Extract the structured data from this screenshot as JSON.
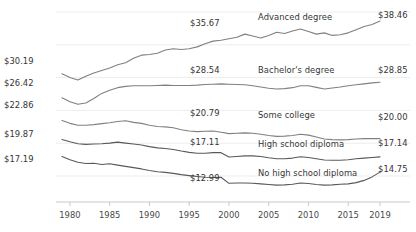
{
  "chart_data": {
    "type": "line",
    "title": "",
    "subtitle": "",
    "xlabel": "",
    "ylabel": "",
    "grid": true,
    "legend_position": "inline-right-of-line",
    "xlim": [
      1979,
      2019
    ],
    "ylim": [
      11.0,
      40.5
    ],
    "x_ticks": [
      "1980",
      "1985",
      "1990",
      "1995",
      "2000",
      "2005",
      "2010",
      "2015",
      "2019"
    ],
    "x_tick_values": [
      1980,
      1985,
      1990,
      1995,
      2000,
      2005,
      2010,
      2015,
      2019
    ],
    "y_ticks": [],
    "x": [
      1979,
      1980,
      1981,
      1982,
      1983,
      1984,
      1985,
      1986,
      1987,
      1988,
      1989,
      1990,
      1991,
      1992,
      1993,
      1994,
      1995,
      1996,
      1997,
      1998,
      1999,
      2000,
      2001,
      2002,
      2003,
      2004,
      2005,
      2006,
      2007,
      2008,
      2009,
      2010,
      2011,
      2012,
      2013,
      2014,
      2015,
      2016,
      2017,
      2018,
      2019
    ],
    "series": [
      {
        "name": "Advanced degree",
        "label": "Advanced degree",
        "color": "#808080",
        "start_label": "$35.67",
        "end_label": "$38.46",
        "start_value": 35.67,
        "end_value": 38.46,
        "values": [
          30.19,
          29.6,
          29.2,
          29.8,
          30.3,
          30.7,
          31.1,
          31.6,
          31.9,
          32.6,
          33.1,
          33.2,
          33.4,
          33.9,
          34.1,
          34.0,
          34.1,
          34.4,
          34.9,
          35.3,
          35.45,
          35.67,
          35.9,
          36.4,
          36.1,
          35.8,
          36.2,
          36.7,
          36.5,
          36.9,
          37.2,
          36.8,
          36.4,
          36.6,
          36.2,
          36.3,
          36.6,
          37.1,
          37.6,
          37.9,
          38.46
        ]
      },
      {
        "name": "Bachelor's degree",
        "label": "Bachelor's degree",
        "color": "#808080",
        "start_label": "$26.42",
        "end_label": "$28.85",
        "start_value": 26.42,
        "end_value": 28.85,
        "values": [
          26.42,
          25.8,
          25.4,
          25.6,
          26.3,
          27.1,
          27.6,
          28.0,
          28.2,
          28.3,
          28.3,
          28.3,
          28.35,
          28.4,
          28.35,
          28.35,
          28.35,
          28.4,
          28.5,
          28.54,
          28.6,
          28.54,
          28.5,
          28.45,
          28.3,
          28.1,
          27.9,
          27.8,
          27.85,
          28.0,
          28.3,
          28.3,
          28.05,
          27.8,
          27.95,
          28.1,
          28.3,
          28.45,
          28.6,
          28.75,
          28.85
        ]
      },
      {
        "name": "Some college",
        "label": "Some college",
        "color": "#808080",
        "start_label": "$22.86",
        "end_label": "$20.00",
        "start_value": 22.86,
        "end_value": 20.0,
        "values": [
          22.86,
          22.4,
          22.1,
          22.1,
          22.2,
          22.35,
          22.5,
          22.7,
          22.8,
          22.55,
          22.4,
          22.1,
          21.9,
          21.85,
          21.7,
          21.4,
          21.2,
          21.1,
          21.15,
          21.2,
          21.0,
          20.79,
          20.85,
          20.9,
          20.85,
          20.7,
          20.5,
          20.35,
          20.4,
          20.5,
          20.7,
          20.55,
          20.25,
          19.95,
          19.85,
          19.8,
          19.85,
          19.95,
          20.0,
          20.0,
          20.0
        ]
      },
      {
        "name": "High school diploma",
        "label": "High school diploma",
        "color": "#595959",
        "start_label": "$19.87",
        "end_label": "$17.14",
        "start_value": 19.87,
        "end_value": 17.14,
        "values": [
          19.87,
          19.5,
          19.2,
          19.1,
          19.15,
          19.2,
          19.3,
          19.45,
          19.3,
          19.15,
          19.0,
          18.75,
          18.55,
          18.45,
          18.3,
          18.05,
          17.85,
          17.7,
          17.7,
          17.8,
          17.8,
          17.11,
          17.2,
          17.3,
          17.3,
          17.2,
          17.0,
          16.85,
          16.85,
          16.95,
          17.15,
          17.05,
          16.85,
          16.65,
          16.6,
          16.6,
          16.7,
          16.85,
          16.95,
          17.05,
          17.14
        ]
      },
      {
        "name": "No high school diploma",
        "label": "No high school diploma",
        "color": "#595959",
        "start_label": "$17.19",
        "end_label": "$14.75",
        "start_value": 17.19,
        "end_value": 14.75,
        "values": [
          17.19,
          16.7,
          16.3,
          16.1,
          16.15,
          15.95,
          16.05,
          15.85,
          15.65,
          15.45,
          15.25,
          15.0,
          14.8,
          14.7,
          14.55,
          14.35,
          14.2,
          14.05,
          13.95,
          13.9,
          13.95,
          12.99,
          13.05,
          13.05,
          13.0,
          12.9,
          12.8,
          12.7,
          12.75,
          12.85,
          13.05,
          12.95,
          12.8,
          12.7,
          12.75,
          12.85,
          12.9,
          13.1,
          13.45,
          14.0,
          14.75
        ]
      }
    ],
    "axis_color": "#c9c9c9",
    "grid_color": "#ededed",
    "background": "#ffffff"
  },
  "annotations": {
    "left_value_labels": [
      {
        "text": "$30.19",
        "x": 4,
        "y": 56
      },
      {
        "text": "$26.42",
        "x": 4,
        "y": 78
      },
      {
        "text": "$22.86",
        "x": 4,
        "y": 100
      },
      {
        "text": "$19.87",
        "x": 4,
        "y": 129
      },
      {
        "text": "$17.19",
        "x": 4,
        "y": 154
      }
    ],
    "mid_value_labels": [
      {
        "text": "$35.67",
        "x": 190,
        "y": 18
      },
      {
        "text": "$28.54",
        "x": 190,
        "y": 65
      },
      {
        "text": "$20.79",
        "x": 190,
        "y": 108
      },
      {
        "text": "$17.11",
        "x": 190,
        "y": 137
      },
      {
        "text": "$12.99",
        "x": 190,
        "y": 173
      }
    ],
    "right_value_labels": [
      {
        "text": "$38.46",
        "x": 378,
        "y": 10
      },
      {
        "text": "$28.85",
        "x": 378,
        "y": 65
      },
      {
        "text": "$20.00",
        "x": 378,
        "y": 112
      },
      {
        "text": "$17.14",
        "x": 378,
        "y": 138
      },
      {
        "text": "$14.75",
        "x": 378,
        "y": 164
      }
    ],
    "series_labels": [
      {
        "text": "Advanced degree",
        "x": 258,
        "y": 12
      },
      {
        "text": "Bachelor's degree",
        "x": 258,
        "y": 65
      },
      {
        "text": "Some college",
        "x": 258,
        "y": 110
      },
      {
        "text": "High school diploma",
        "x": 258,
        "y": 139
      },
      {
        "text": "No high school diploma",
        "x": 258,
        "y": 168
      }
    ]
  }
}
